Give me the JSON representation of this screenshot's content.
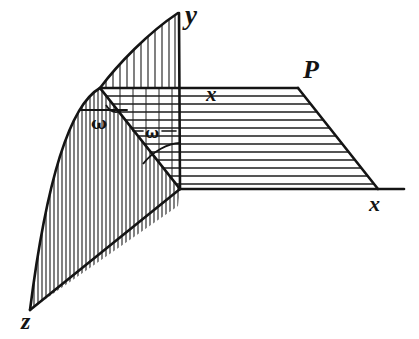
{
  "figure": {
    "kind": "line-drawing",
    "background_color": "#ffffff",
    "ink_color": "#141414",
    "labels": {
      "y_axis": "y",
      "x_axis": "x",
      "z_axis": "z",
      "plane": "P",
      "trace_x": "x",
      "angle_1": "ω",
      "angle_2": "ω"
    },
    "geometry": {
      "origin": {
        "x": 180,
        "y": 189
      },
      "y_axis_top": {
        "x": 179,
        "y": 13
      },
      "x_axis_end": {
        "x": 404,
        "y": 189
      },
      "z_vertex": {
        "x": 30,
        "y": 310
      },
      "corner_vertex": {
        "x": 100,
        "y": 88
      },
      "plane_top_right": {
        "x": 298,
        "y": 88
      },
      "plane_bottom_right": {
        "x": 378,
        "y": 189
      }
    },
    "hatching": {
      "horizontal_plane_lines": 12,
      "horizontal_plane_direction": "horizontal",
      "curved_region_direction": "vertical",
      "curved_region_lines": 38,
      "upper_triangle_direction": "vertical",
      "upper_triangle_lines": 11
    }
  }
}
